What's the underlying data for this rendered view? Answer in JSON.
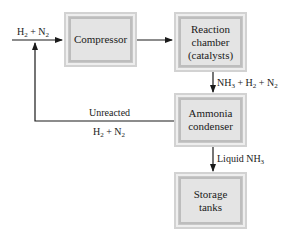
{
  "diagram": {
    "type": "process-flow",
    "nodes": [
      {
        "id": "compressor",
        "lines": [
          "Compressor"
        ]
      },
      {
        "id": "reaction",
        "lines": [
          "Reaction",
          "chamber",
          "(catalysts)"
        ]
      },
      {
        "id": "condenser",
        "lines": [
          "Ammonia",
          "condenser"
        ]
      },
      {
        "id": "storage",
        "lines": [
          "Storage",
          "tanks"
        ]
      }
    ],
    "edges": [
      {
        "from": "input",
        "to": "compressor",
        "label": {
          "parts": [
            "H",
            "2",
            " + N",
            "2"
          ]
        }
      },
      {
        "from": "compressor",
        "to": "reaction",
        "label": null
      },
      {
        "from": "reaction",
        "to": "condenser",
        "label": {
          "parts": [
            "NH",
            "3",
            " + H",
            "2",
            " + N",
            "2"
          ]
        }
      },
      {
        "from": "condenser",
        "to": "storage",
        "label": {
          "parts": [
            "Liquid NH",
            "3"
          ]
        }
      },
      {
        "from": "condenser",
        "to": "compressor",
        "label": {
          "top": "Unreacted",
          "bottom_parts": [
            "H",
            "2",
            " + N",
            "2"
          ]
        }
      }
    ],
    "colors": {
      "box_fill": "#e4e4e4",
      "box_border": "#bdbdbd",
      "line": "#1a1a1a"
    }
  }
}
